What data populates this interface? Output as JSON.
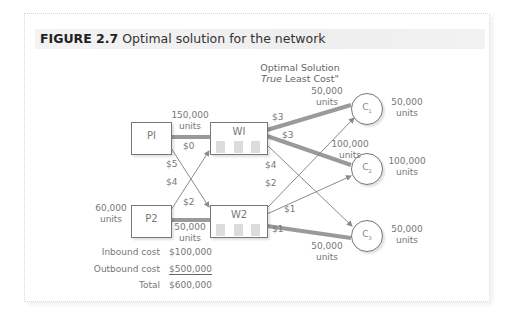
{
  "figure": {
    "label": "FIGURE 2.7",
    "caption": "Optimal solution for the network"
  },
  "heading": {
    "line1": "Optimal Solution",
    "line2_italic": "True",
    "line2_rest": " Least Cost\""
  },
  "nodes": {
    "plants": [
      {
        "id": "P1",
        "label": "PI"
      },
      {
        "id": "P2",
        "label": "P2",
        "capacity": "60,000",
        "capacity_unit": "units"
      }
    ],
    "warehouses": [
      {
        "id": "W1",
        "label": "WI"
      },
      {
        "id": "W2",
        "label": "W2"
      }
    ],
    "customers": [
      {
        "id": "C1",
        "label": "C",
        "sub": "1",
        "demand": "50,000",
        "unit": "units"
      },
      {
        "id": "C2",
        "label": "C",
        "sub": "2",
        "demand": "100,000",
        "unit": "units"
      },
      {
        "id": "C3",
        "label": "C",
        "sub": "3",
        "demand": "50,000",
        "unit": "units"
      }
    ]
  },
  "edges": [
    {
      "from": "P1",
      "to": "W1",
      "cost": "$0",
      "flow": "150,000",
      "flow_unit": "units",
      "used": true
    },
    {
      "from": "P1",
      "to": "W2",
      "cost": "$5",
      "used": false
    },
    {
      "from": "P2",
      "to": "W1",
      "cost": "$4",
      "used": false
    },
    {
      "from": "P2",
      "to": "W2",
      "cost": "$2",
      "flow": "50,000",
      "flow_unit": "units",
      "used": true
    },
    {
      "from": "W1",
      "to": "C1",
      "cost": "$3",
      "flow": "50,000",
      "flow_unit": "units",
      "used": true
    },
    {
      "from": "W1",
      "to": "C2",
      "cost": "$3",
      "flow": "100,000",
      "flow_unit": "units",
      "used": true
    },
    {
      "from": "W1",
      "to": "C3",
      "cost": "$4",
      "used": false
    },
    {
      "from": "W2",
      "to": "C1",
      "cost": "$2",
      "used": false
    },
    {
      "from": "W2",
      "to": "C2",
      "cost": "$1",
      "used": false
    },
    {
      "from": "W2",
      "to": "C3",
      "cost": "$1",
      "flow": "50,000",
      "flow_unit": "units",
      "used": true
    }
  ],
  "costs": {
    "inbound_label": "Inbound cost",
    "inbound_value": "$100,000",
    "outbound_label": "Outbound cost",
    "outbound_value": "$500,000",
    "total_label": "Total",
    "total_value": "$600,000"
  },
  "colors": {
    "used_edge": "#9a9a9a",
    "unused_edge": "#8a8a8a",
    "node_border": "#777777",
    "text": "#777777"
  }
}
